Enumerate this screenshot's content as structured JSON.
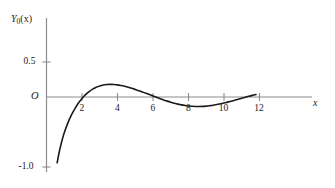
{
  "chart_data": {
    "type": "line",
    "title": "",
    "subtitle": "",
    "xlabel": "x",
    "ylabel": "Y_0(x)",
    "ylabel_base": "Y",
    "ylabel_sub": "0",
    "ylabel_arg": "(x)",
    "origin_label": "O",
    "xlim": [
      0,
      13.2
    ],
    "ylim": [
      -1.12,
      0.72
    ],
    "grid": false,
    "legend": null,
    "x_ticks": [
      2,
      4,
      6,
      8,
      10,
      12
    ],
    "x_tick_labels": [
      "2",
      "4",
      "6",
      "8",
      "10",
      "12"
    ],
    "y_ticks": [
      0.5,
      -1.0
    ],
    "y_tick_labels": [
      "0.5",
      "-1.0"
    ],
    "series": [
      {
        "name": "Y0(x)",
        "color": "#1a1a1a",
        "x": [
          0.6,
          0.7,
          0.8,
          0.9,
          1.0,
          1.2,
          1.4,
          1.6,
          1.8,
          2.0,
          2.2,
          2.4,
          2.6,
          2.8,
          3.0,
          3.2,
          3.4,
          3.6,
          3.8,
          4.0,
          4.2,
          4.4,
          4.6,
          4.8,
          5.0,
          5.2,
          5.4,
          5.6,
          5.8,
          6.0,
          6.2,
          6.4,
          6.6,
          6.8,
          7.0,
          7.2,
          7.4,
          7.6,
          7.8,
          8.0,
          8.2,
          8.4,
          8.6,
          8.8,
          9.0,
          9.2,
          9.4,
          9.6,
          9.8,
          10.0,
          10.2,
          10.4,
          10.6,
          10.8,
          11.0,
          11.2,
          11.4,
          11.6,
          11.8
        ],
        "y": [
          -0.94,
          -0.807,
          -0.695,
          -0.597,
          -0.51,
          -0.373,
          -0.259,
          -0.165,
          -0.086,
          -0.02,
          0.034,
          0.078,
          0.113,
          0.139,
          0.158,
          0.171,
          0.178,
          0.18,
          0.178,
          0.173,
          0.164,
          0.153,
          0.14,
          0.125,
          0.108,
          0.091,
          0.072,
          0.053,
          0.034,
          0.014,
          -0.005,
          -0.024,
          -0.042,
          -0.059,
          -0.075,
          -0.089,
          -0.102,
          -0.112,
          -0.121,
          -0.128,
          -0.133,
          -0.135,
          -0.136,
          -0.134,
          -0.13,
          -0.124,
          -0.117,
          -0.108,
          -0.097,
          -0.086,
          -0.073,
          -0.06,
          -0.046,
          -0.032,
          -0.018,
          -0.004,
          0.01,
          0.023,
          0.036
        ],
        "note": "Bessel function of the second kind, order zero; plotted y values here are the raw Y0(x) values"
      }
    ],
    "annotations": [
      {
        "label": "first zero crossing",
        "x": 0.894,
        "y": 0.0
      },
      {
        "label": "first maximum",
        "x": 2.2,
        "y": 0.5
      },
      {
        "label": "first minimum",
        "x": 5.45,
        "y": -0.37
      },
      {
        "label": "second maximum",
        "x": 8.6,
        "y": 0.28
      },
      {
        "label": "second zero crossing",
        "x": 3.96,
        "y": 0.0
      },
      {
        "label": "third zero crossing",
        "x": 7.09,
        "y": 0.0
      },
      {
        "label": "fourth zero crossing",
        "x": 10.22,
        "y": 0.0
      },
      {
        "label": "curve start",
        "x": 0.6,
        "y": -0.94
      },
      {
        "label": "curve end",
        "x": 12.65,
        "y": -0.18
      }
    ]
  },
  "figure": {
    "axis_color": "#8c8c8c",
    "curve_color": "#1a1a1a",
    "text_color": "#1a1a1a",
    "background": "#ffffff"
  }
}
